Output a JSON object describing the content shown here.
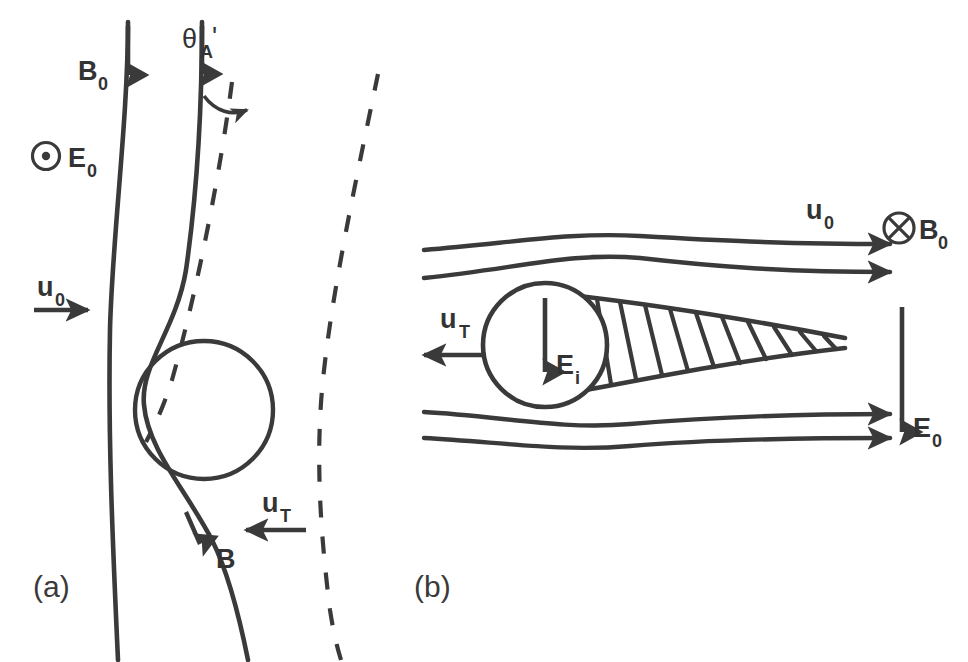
{
  "figure": {
    "stroke_color": "#3a3a3a",
    "label_color": "#333333",
    "background": "#ffffff",
    "width": 968,
    "height": 662
  },
  "panel_a": {
    "id": "(a)",
    "labels": {
      "b0": "B",
      "b0_sub": "0",
      "e0": "E",
      "e0_sub": "0",
      "u0": "u",
      "u0_sub": "0",
      "ut": "u",
      "ut_sub": "T",
      "b": "B",
      "theta": "θ",
      "theta_sub": "A",
      "theta_prime": "'"
    },
    "icons": {
      "e0_symbol": "circle-dot-icon",
      "b0_arrow": "arrow-down-icon",
      "b_arrow": "arrow-down-icon",
      "u0_arrow": "arrow-right-icon",
      "ut_arrow": "arrow-left-icon",
      "theta_arc": "curved-arrow-icon"
    },
    "notes": {
      "e0_direction": "out of page",
      "obstacle": "open circle",
      "field_lines": 2,
      "dashed_lines": 2
    }
  },
  "panel_b": {
    "id": "(b)",
    "labels": {
      "u0": "u",
      "u0_sub": "0",
      "b0": "B",
      "b0_sub": "0",
      "e0": "E",
      "e0_sub": "0",
      "ei": "E",
      "ei_sub": "i",
      "ut": "u",
      "ut_sub": "T"
    },
    "icons": {
      "b0_symbol": "circle-cross-icon",
      "u0_arrow": "arrow-right-icon",
      "e0_arrow": "arrow-down-icon",
      "ei_arrow": "arrow-down-icon",
      "ut_arrow": "arrow-left-icon"
    },
    "notes": {
      "b0_direction": "into page",
      "obstacle": "open circle",
      "streamlines_top": 2,
      "streamlines_bottom": 2,
      "wake": "hatched tapering wedge",
      "hatch_count": 11
    }
  }
}
